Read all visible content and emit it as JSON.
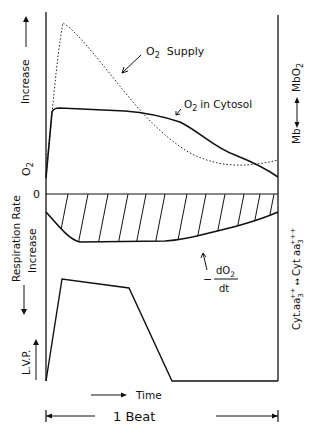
{
  "figure": {
    "left_axis": {
      "top_label_o2": "O",
      "top_label_o2_sub": "2",
      "top_label_increase": "Increase",
      "zero_label": "0",
      "mid_label_respiration": "Respiration Rate",
      "mid_label_increase": "Increase",
      "bottom_label": "L.V.P."
    },
    "right_axis": {
      "upper_label_mb": "Mb",
      "upper_label_mbo2": "MbO",
      "upper_label_mbo2_sub": "2",
      "lower_label": "Cyt.aa3++ ↔ Cyt aa3+++",
      "lower_left": "Cyt.aa",
      "lower_left_sub": "3",
      "lower_left_sup": "++",
      "lower_right": "Cyt aa",
      "lower_right_sub": "3",
      "lower_right_sup": "+++"
    },
    "annotations": {
      "o2_supply_o": "O",
      "o2_supply_sub": "2",
      "o2_supply_text": "Supply",
      "o2_cytosol_o": "O",
      "o2_cytosol_sub": "2",
      "o2_cytosol_text": "in Cytosol",
      "rate_minus": "−",
      "rate_numerator": "dO",
      "rate_numerator_sub": "2",
      "rate_denominator": "dt"
    },
    "time_label": "Time",
    "beat_label": "1 Beat"
  },
  "series": {
    "o2_supply": {
      "style": "dotted",
      "description": "rapid rise to early peak then gradual decline over the beat"
    },
    "o2_cytosol": {
      "style": "solid",
      "description": "rapid rise to plateau, then decline in late beat"
    },
    "respiration_rate": {
      "style": "solid, hatched area",
      "description": "negative dO2/dt, largest mid-beat"
    },
    "lvp": {
      "style": "solid",
      "description": "left ventricular pressure: sharp rise, plateau with slight decline, fall to baseline"
    }
  }
}
